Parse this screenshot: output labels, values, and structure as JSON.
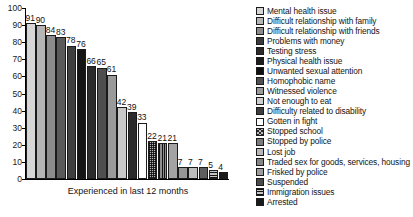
{
  "chart_data": {
    "type": "bar",
    "title": "",
    "xlabel": "Experienced in last 12 months",
    "ylabel": "",
    "ylim": [
      0,
      100
    ],
    "ytick_labels": [
      "100",
      "90",
      "80",
      "70",
      "60",
      "50",
      "40",
      "30",
      "20",
      "10",
      "0"
    ],
    "yticks": [
      100,
      90,
      80,
      70,
      60,
      50,
      40,
      30,
      20,
      10,
      0
    ],
    "grid": false,
    "legend_position": "right",
    "categories": [
      "Mental health issue",
      "Difficult relationship with family",
      "Difficult relationship with friends",
      "Problems with money",
      "Testing stress",
      "Physical health issue",
      "Unwanted sexual attention",
      "Homophobic name",
      "Witnessed violence",
      "Not enough to eat",
      "Difficulty related to disability",
      "Gotten in fight",
      "Stopped school",
      "Stopped by police",
      "Lost job",
      "Traded sex for goods, services, housing",
      "Frisked by police",
      "Suspended",
      "Immigration issues",
      "Arrested"
    ],
    "values": [
      91,
      90,
      84,
      83,
      78,
      76,
      66,
      65,
      61,
      42,
      39,
      33,
      22,
      21,
      21,
      7,
      7,
      7,
      5,
      4
    ],
    "data_labels": [
      "91",
      "90",
      "84",
      "83",
      "78",
      "76",
      "66",
      "65",
      "61",
      "42",
      "39",
      "33",
      "22",
      "21",
      "21",
      "7",
      "7",
      "7",
      "5",
      "4"
    ],
    "bar_styles": [
      {
        "fill": "#d6d6d6",
        "pattern": "solid"
      },
      {
        "fill": "#b5b5b5",
        "pattern": "solid"
      },
      {
        "fill": "#8c8c8c",
        "pattern": "solid"
      },
      {
        "fill": "#5a5a5a",
        "pattern": "solid"
      },
      {
        "fill": "#3f3f3f",
        "pattern": "solid"
      },
      {
        "fill": "#151515",
        "pattern": "solid"
      },
      {
        "fill": "#2c2c2c",
        "pattern": "solid"
      },
      {
        "fill": "#4f4f4f",
        "pattern": "solid"
      },
      {
        "fill": "#9a9a9a",
        "pattern": "solid"
      },
      {
        "fill": "#c9c9c9",
        "pattern": "solid"
      },
      {
        "fill": "#2b2b2b",
        "pattern": "solid"
      },
      {
        "fill": "#ffffff",
        "pattern": "solid"
      },
      {
        "fill": "#b0b0b0",
        "pattern": "dots"
      },
      {
        "fill": "#8f8f8f",
        "pattern": "vlines"
      },
      {
        "fill": "#a3a3a3",
        "pattern": "solid"
      },
      {
        "fill": "#969696",
        "pattern": "solid"
      },
      {
        "fill": "#bdbdbd",
        "pattern": "solid"
      },
      {
        "fill": "#5e5e5e",
        "pattern": "solid"
      },
      {
        "fill": "#c4c4c4",
        "pattern": "hlines"
      },
      {
        "fill": "#1a1a1a",
        "pattern": "solid"
      }
    ],
    "legend_styles": [
      {
        "fill": "#d6d6d6",
        "pattern": "solid"
      },
      {
        "fill": "#b5b5b5",
        "pattern": "solid"
      },
      {
        "fill": "#8c8c8c",
        "pattern": "solid"
      },
      {
        "fill": "#3a3a3a",
        "pattern": "solid"
      },
      {
        "fill": "#2a2a2a",
        "pattern": "solid"
      },
      {
        "fill": "#1d1d1d",
        "pattern": "solid"
      },
      {
        "fill": "#101010",
        "pattern": "solid"
      },
      {
        "fill": "#4f4f4f",
        "pattern": "solid"
      },
      {
        "fill": "#9a9a9a",
        "pattern": "solid"
      },
      {
        "fill": "#cfcfcf",
        "pattern": "solid"
      },
      {
        "fill": "#3d3d3d",
        "pattern": "solid"
      },
      {
        "fill": "#ffffff",
        "pattern": "solid"
      },
      {
        "fill": "#bdbdbd",
        "pattern": "crosshatch"
      },
      {
        "fill": "#7a7a7a",
        "pattern": "solid"
      },
      {
        "fill": "#b8b8b8",
        "pattern": "solid"
      },
      {
        "fill": "#858585",
        "pattern": "solid"
      },
      {
        "fill": "#9d9d9d",
        "pattern": "solid"
      },
      {
        "fill": "#4a4a4a",
        "pattern": "solid"
      },
      {
        "fill": "#c4c4c4",
        "pattern": "hlines"
      },
      {
        "fill": "#1a1a1a",
        "pattern": "solid"
      }
    ]
  }
}
